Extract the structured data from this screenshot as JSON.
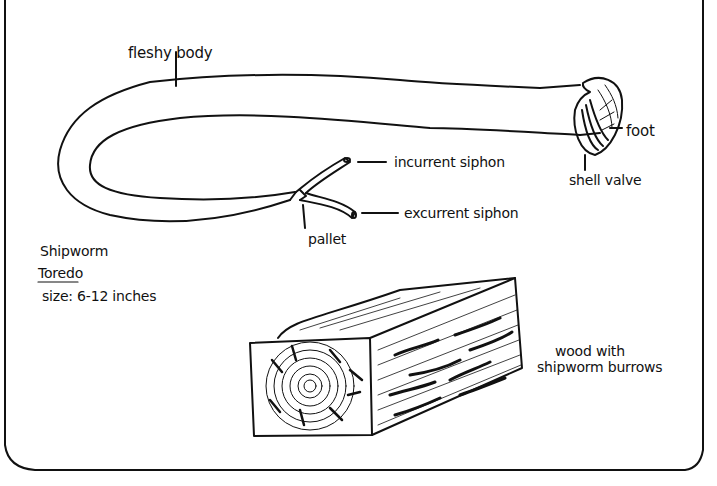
{
  "diagram": {
    "subject": "Shipworm",
    "genus": "Toredo",
    "size": "size: 6-12 inches",
    "ink_color": "#111111",
    "paper_color": "#ffffff",
    "labels": {
      "fleshy_body": "fleshy body",
      "foot": "foot",
      "shell_valve": "shell valve",
      "incurrent_siphon": "incurrent siphon",
      "excurrent_siphon": "excurrent siphon",
      "pallet": "pallet",
      "wood_line1": "wood with",
      "wood_line2": "shipworm burrows"
    }
  }
}
